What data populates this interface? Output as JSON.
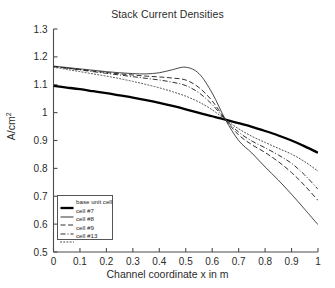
{
  "chart_data": {
    "type": "line",
    "title": "Stack Current Densities",
    "xlabel": "Channel coordinate x in m",
    "ylabel": "A/cm2",
    "ylabel_base": "A/cm",
    "ylabel_exp": "2",
    "xlim": [
      0,
      1
    ],
    "ylim": [
      0.5,
      1.3
    ],
    "grid": false,
    "legend_position": "lower left",
    "xticks": [
      0,
      0.1,
      0.2,
      0.3,
      0.4,
      0.5,
      0.6,
      0.7,
      0.8,
      0.9,
      1
    ],
    "xtick_labels": [
      "0",
      "0.1",
      "0.2",
      "0.3",
      "0.4",
      "0.5",
      "0.6",
      "0.7",
      "0.8",
      "0.9",
      "1"
    ],
    "yticks": [
      0.5,
      0.6,
      0.7,
      0.8,
      0.9,
      1.0,
      1.1,
      1.2,
      1.3
    ],
    "ytick_labels": [
      "0.5",
      "0.6",
      "0.7",
      "0.8",
      "0.9",
      "1",
      "1.1",
      "1.2",
      "1.3"
    ],
    "x": [
      0,
      0.05,
      0.1,
      0.15,
      0.2,
      0.25,
      0.3,
      0.35,
      0.4,
      0.45,
      0.5,
      0.55,
      0.6,
      0.65,
      0.7,
      0.75,
      0.8,
      0.85,
      0.9,
      0.95,
      1
    ],
    "series": [
      {
        "name": "base unit cell",
        "style": "solid",
        "width": 2.3,
        "color": "#000000",
        "values": [
          1.096,
          1.09,
          1.084,
          1.077,
          1.07,
          1.062,
          1.054,
          1.045,
          1.035,
          1.024,
          1.012,
          0.999,
          0.987,
          0.975,
          0.962,
          0.949,
          0.934,
          0.918,
          0.9,
          0.879,
          0.856
        ]
      },
      {
        "name": "cell #7",
        "style": "solid",
        "width": 0.8,
        "color": "#1a1a1a",
        "values": [
          1.167,
          1.162,
          1.157,
          1.152,
          1.147,
          1.143,
          1.14,
          1.139,
          1.143,
          1.154,
          1.163,
          1.14,
          1.07,
          0.975,
          0.9,
          0.855,
          0.805,
          0.758,
          0.707,
          0.653,
          0.598
        ]
      },
      {
        "name": "cell #8",
        "style": "dashed",
        "width": 0.9,
        "color": "#1a1a1a",
        "values": [
          1.166,
          1.16,
          1.155,
          1.149,
          1.144,
          1.139,
          1.135,
          1.131,
          1.128,
          1.124,
          1.117,
          1.09,
          1.042,
          0.975,
          0.92,
          0.885,
          0.857,
          0.824,
          0.785,
          0.738,
          0.685
        ]
      },
      {
        "name": "cell #9",
        "style": "dashdot",
        "width": 0.9,
        "color": "#1a1a1a",
        "values": [
          1.165,
          1.159,
          1.153,
          1.147,
          1.141,
          1.135,
          1.129,
          1.123,
          1.117,
          1.109,
          1.097,
          1.071,
          1.029,
          0.975,
          0.93,
          0.898,
          0.874,
          0.848,
          0.818,
          0.776,
          0.725
        ]
      },
      {
        "name": "cell #13",
        "style": "dotted",
        "width": 1.0,
        "color": "#4d4d4d",
        "values": [
          1.163,
          1.155,
          1.147,
          1.139,
          1.131,
          1.122,
          1.112,
          1.101,
          1.089,
          1.075,
          1.059,
          1.038,
          1.01,
          0.975,
          0.942,
          0.915,
          0.893,
          0.872,
          0.851,
          0.824,
          0.79
        ]
      }
    ]
  }
}
